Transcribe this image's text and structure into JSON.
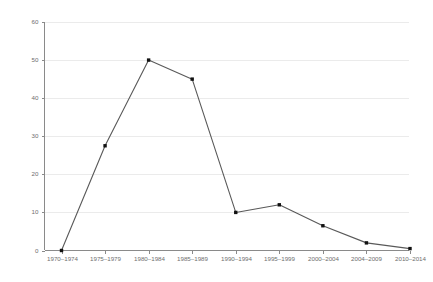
{
  "chart_data": {
    "type": "line",
    "title": "",
    "subtitle": "",
    "xlabel": "",
    "ylabel": "",
    "categories": [
      "1970–1974",
      "1975–1979",
      "1980–1984",
      "1985–1989",
      "1990–1994",
      "1995–1999",
      "2000–2004",
      "2004–2009",
      "2010–2014"
    ],
    "values": [
      0,
      27.5,
      50,
      45,
      10,
      12,
      6.5,
      2,
      0.5
    ],
    "ylim": [
      0,
      60
    ],
    "yticks": [
      0,
      10,
      20,
      30,
      40,
      50,
      60
    ],
    "ytick_labels": [
      "0",
      "10",
      "20",
      "30",
      "40",
      "50",
      "60"
    ],
    "grid": "horizontal",
    "legend": "none",
    "marker": "square",
    "annotations": [],
    "colors": {
      "line": "#595959",
      "marker": "#111111",
      "gridline": "#ebebeb",
      "axis": "#8a8a8a",
      "tick_text": "#6e6e6e",
      "background": "#ffffff"
    }
  }
}
